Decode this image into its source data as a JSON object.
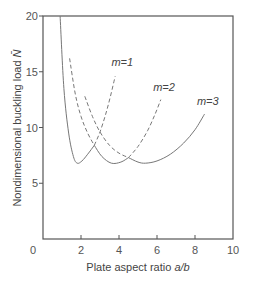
{
  "chart_data": {
    "type": "line",
    "title": "",
    "xlabel": "Plate aspect ratio a/b",
    "xlabel_plain": "Plate aspect ratio ",
    "xlabel_italic": "a/b",
    "ylabel": "Nondimensional buckling load N̄",
    "ylabel_plain": "Nondimensional buckling load ",
    "ylabel_italic": "N̄",
    "xlim": [
      0,
      10
    ],
    "ylim": [
      0,
      20
    ],
    "xticks": [
      2,
      4,
      6,
      8,
      10
    ],
    "yticks": [
      0,
      5,
      10,
      15,
      20
    ],
    "origin_label": "0",
    "grid": false,
    "legend": "inline labels",
    "series": [
      {
        "name": "m=1",
        "label": "m=1",
        "solid": [
          [
            0.9,
            20
          ],
          [
            1.1,
            13.5
          ],
          [
            1.35,
            9.5
          ],
          [
            1.6,
            7.4
          ],
          [
            1.8,
            6.8
          ],
          [
            2.05,
            7.0
          ],
          [
            2.35,
            7.6
          ],
          [
            2.7,
            8.4
          ]
        ],
        "dashed": [
          [
            2.7,
            8.4
          ],
          [
            3.0,
            9.6
          ],
          [
            3.3,
            11.2
          ],
          [
            3.55,
            12.8
          ],
          [
            3.8,
            14.6
          ]
        ],
        "label_pos": [
          3.6,
          15.5
        ]
      },
      {
        "name": "m=2",
        "label": "m=2",
        "dashed_left": [
          [
            1.4,
            16.2
          ],
          [
            1.7,
            13.0
          ],
          [
            2.0,
            11.0
          ],
          [
            2.35,
            9.5
          ],
          [
            2.7,
            8.4
          ]
        ],
        "solid": [
          [
            2.7,
            8.4
          ],
          [
            3.1,
            7.4
          ],
          [
            3.6,
            6.8
          ],
          [
            4.1,
            6.9
          ],
          [
            4.5,
            7.3
          ]
        ],
        "dashed_right": [
          [
            4.5,
            7.3
          ],
          [
            5.0,
            8.3
          ],
          [
            5.5,
            9.7
          ],
          [
            5.9,
            11.2
          ],
          [
            6.2,
            12.5
          ]
        ],
        "label_pos": [
          5.8,
          13.3
        ]
      },
      {
        "name": "m=3",
        "label": "m=3",
        "dashed_left": [
          [
            2.2,
            12.8
          ],
          [
            2.6,
            11.0
          ],
          [
            3.0,
            9.6
          ],
          [
            3.5,
            8.4
          ],
          [
            4.0,
            7.7
          ],
          [
            4.5,
            7.3
          ]
        ],
        "solid": [
          [
            4.5,
            7.3
          ],
          [
            5.0,
            6.9
          ],
          [
            5.4,
            6.8
          ],
          [
            6.0,
            7.0
          ],
          [
            6.7,
            7.6
          ],
          [
            7.4,
            8.6
          ],
          [
            8.0,
            9.8
          ],
          [
            8.5,
            11.2
          ]
        ],
        "label_pos": [
          8.1,
          12.0
        ]
      }
    ]
  }
}
